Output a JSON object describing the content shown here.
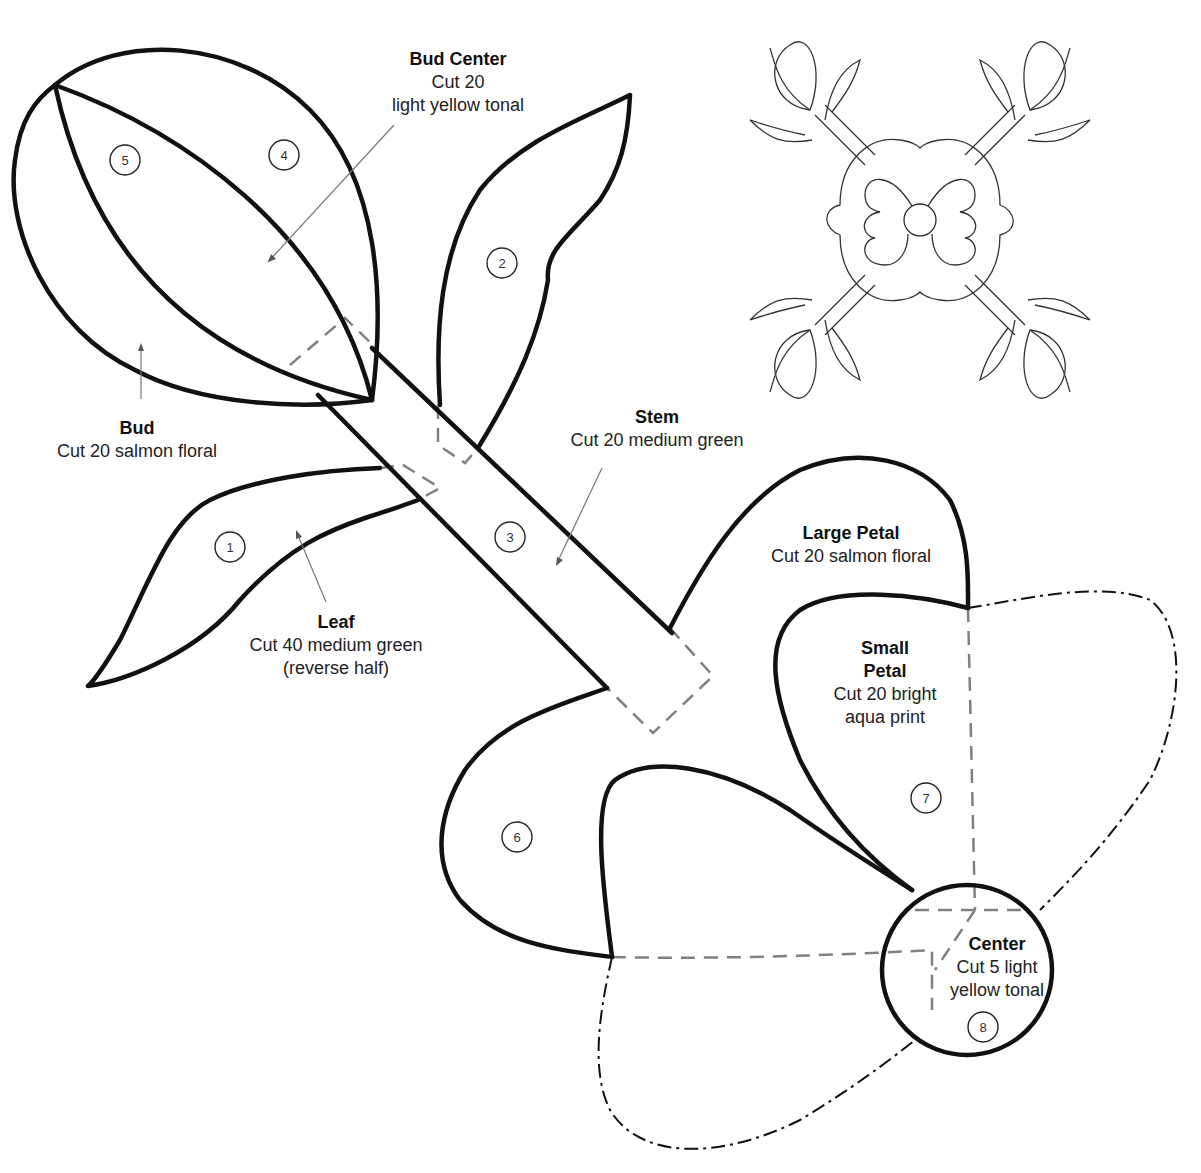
{
  "diagram": {
    "type": "applique quilt pattern",
    "colors": {
      "outline": "#111111",
      "seam_allowance": "#808080",
      "leader": "#777777",
      "background": "#ffffff"
    }
  },
  "pieces": [
    {
      "number": "1",
      "name": "Leaf",
      "lines": [
        "Cut 40 medium green",
        "(reverse half)"
      ]
    },
    {
      "number": "2",
      "name": "Leaf",
      "lines": []
    },
    {
      "number": "3",
      "name": "Stem",
      "lines": [
        "Cut 20 medium green"
      ]
    },
    {
      "number": "4",
      "name": "Bud",
      "lines": [
        "Cut 20 salmon floral"
      ]
    },
    {
      "number": "5",
      "name": "Bud Center",
      "lines": [
        "Cut 20",
        "light yellow tonal"
      ]
    },
    {
      "number": "6",
      "name": "Large Petal",
      "lines": [
        "Cut 20 salmon floral"
      ]
    },
    {
      "number": "7",
      "name": "Small Petal",
      "lines": [
        "Cut 20 bright",
        "aqua print"
      ]
    },
    {
      "number": "8",
      "name": "Center",
      "lines": [
        "Cut 5 light",
        "yellow tonal"
      ]
    }
  ],
  "labels": {
    "bud_center": {
      "title": "Bud Center",
      "line1": "Cut 20",
      "line2": "light yellow tonal"
    },
    "bud": {
      "title": "Bud",
      "line1": "Cut 20 salmon floral"
    },
    "stem": {
      "title": "Stem",
      "line1": "Cut 20 medium green"
    },
    "leaf": {
      "title": "Leaf",
      "line1": "Cut 40 medium green",
      "line2": "(reverse half)"
    },
    "large_petal": {
      "title": "Large Petal",
      "line1": "Cut 20 salmon floral"
    },
    "small_petal": {
      "title1": "Small",
      "title2": "Petal",
      "line1": "Cut 20 bright",
      "line2": "aqua print"
    },
    "center": {
      "title": "Center",
      "line1": "Cut 5 light",
      "line2": "yellow tonal"
    }
  },
  "numbers": {
    "n1": "1",
    "n2": "2",
    "n3": "3",
    "n4": "4",
    "n5": "5",
    "n6": "6",
    "n7": "7",
    "n8": "8"
  },
  "block_preview": {
    "description": "Full quilt block placement diagram"
  }
}
